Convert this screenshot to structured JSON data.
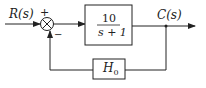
{
  "diagram": {
    "type": "block-diagram",
    "input": {
      "label": "R(s)"
    },
    "output": {
      "label": "C(s)"
    },
    "summing_junction": {
      "plus_sign": "+",
      "minus_sign": "−"
    },
    "forward_block": {
      "numerator": "10",
      "denominator": "s + 1"
    },
    "feedback_block": {
      "label": "H",
      "subscript": "0"
    },
    "colors": {
      "stroke": "#222222",
      "background": "#ffffff"
    }
  }
}
